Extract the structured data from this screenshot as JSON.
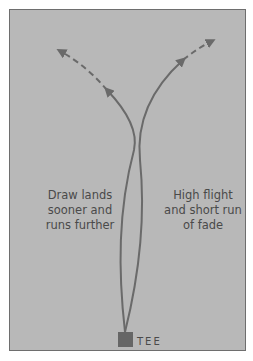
{
  "diagram": {
    "left_label": "Draw lands\nsooner and\nruns further",
    "right_label": "High flight\nand short run\nof fade",
    "tee_label": "TEE"
  },
  "colors": {
    "background": "#b8b8b8",
    "border": "#6e6e6e",
    "line": "#6a6a6a",
    "tee": "#666666",
    "text": "#4a4a4a"
  }
}
